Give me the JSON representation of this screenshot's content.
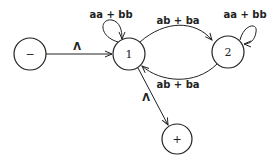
{
  "diagram": {
    "type": "finite-automaton",
    "states": [
      {
        "id": "start",
        "label": "−",
        "role": "start"
      },
      {
        "id": "s1",
        "label": "1"
      },
      {
        "id": "s2",
        "label": "2"
      },
      {
        "id": "final",
        "label": "+",
        "role": "final"
      }
    ],
    "edges": [
      {
        "from": "start",
        "to": "s1",
        "label": "Λ"
      },
      {
        "from": "s1",
        "to": "s1",
        "label": "aa + bb"
      },
      {
        "from": "s1",
        "to": "s2",
        "label": "ab + ba"
      },
      {
        "from": "s2",
        "to": "s1",
        "label": "ab + ba"
      },
      {
        "from": "s2",
        "to": "s2",
        "label": "aa + bb"
      },
      {
        "from": "s1",
        "to": "final",
        "label": "Λ"
      }
    ]
  }
}
